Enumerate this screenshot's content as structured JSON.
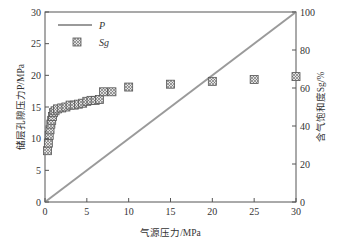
{
  "chart_data": {
    "type": "line+scatter",
    "xlabel": "气源压力/MPa",
    "ylabel_left": "储层孔隙压力P/MPa",
    "ylabel_right": "含气饱和度Sg/%",
    "xlim": [
      0,
      30
    ],
    "ylim_left": [
      0,
      30
    ],
    "ylim_right": [
      0,
      100
    ],
    "x_ticks": [
      0,
      5,
      10,
      15,
      20,
      25,
      30
    ],
    "y_ticks_left": [
      0,
      5,
      10,
      15,
      20,
      25,
      30
    ],
    "y_ticks_right": [
      0,
      20,
      40,
      60,
      80,
      100
    ],
    "legend": [
      {
        "name": "P",
        "marker": "line",
        "color": "#9a9a9a"
      },
      {
        "name": "Sg",
        "marker": "hatched-square",
        "color": "#555555"
      }
    ],
    "series": [
      {
        "name": "P",
        "axis": "left",
        "type": "line",
        "x": [
          0,
          30
        ],
        "y": [
          0,
          30
        ]
      },
      {
        "name": "Sg",
        "axis": "right",
        "type": "scatter",
        "x": [
          0.3,
          0.4,
          0.5,
          0.6,
          0.7,
          0.8,
          0.9,
          1.0,
          1.2,
          1.5,
          2.0,
          2.5,
          3.0,
          3.5,
          4.0,
          4.5,
          5.0,
          5.5,
          6.0,
          6.5,
          7.0,
          8.0,
          10.0,
          15.0,
          20.0,
          25.0,
          30.0
        ],
        "y": [
          27,
          31,
          35,
          38,
          41,
          43,
          45,
          47,
          48,
          49,
          49.5,
          50,
          51,
          51,
          51.5,
          52,
          53,
          53.5,
          53.5,
          54,
          58,
          58,
          60.5,
          62,
          63.5,
          64.5,
          66
        ]
      }
    ]
  }
}
